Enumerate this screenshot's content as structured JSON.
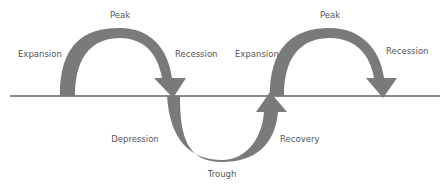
{
  "diagram": {
    "labels": {
      "peak_1": "Peak",
      "expansion_1": "Expansion",
      "recession_1": "Recession",
      "depression": "Depression",
      "trough": "Trough",
      "recovery": "Recovery",
      "expansion_2": "Expansion",
      "peak_2": "Peak",
      "recession_2": "Recession"
    },
    "colors": {
      "arrow": "#7a7a7a",
      "baseline": "#8a8a8a",
      "text": "#555555"
    }
  }
}
